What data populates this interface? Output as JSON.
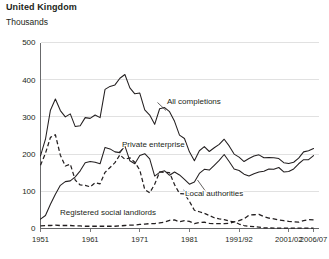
{
  "header": {
    "title": "United Kingdom",
    "unit_label": "Thousands"
  },
  "chart_data": {
    "type": "line",
    "title": "United Kingdom",
    "subtitle": "Thousands",
    "xlabel": "",
    "ylabel": "Thousands",
    "ylim": [
      0,
      500
    ],
    "xlim": [
      1951,
      2007
    ],
    "grid": true,
    "legend_position": "inline-annotations",
    "y_ticks": [
      0,
      100,
      200,
      300,
      400,
      500
    ],
    "x_ticks": [
      1951,
      1961,
      1971,
      1981,
      1991,
      2001,
      2006
    ],
    "x_tick_labels": [
      "1951",
      "1961",
      "1971",
      "1981",
      "1991/92",
      "2001/02",
      "2006/07"
    ],
    "series": [
      {
        "name": "All completions",
        "style": "solid",
        "x": [
          1951,
          1952,
          1953,
          1954,
          1955,
          1956,
          1957,
          1958,
          1959,
          1960,
          1961,
          1962,
          1963,
          1964,
          1965,
          1966,
          1967,
          1968,
          1969,
          1970,
          1971,
          1972,
          1973,
          1974,
          1975,
          1976,
          1977,
          1978,
          1979,
          1980,
          1981,
          1982,
          1983,
          1984,
          1985,
          1986,
          1987,
          1988,
          1989,
          1990,
          1991,
          1992,
          1993,
          1994,
          1995,
          1996,
          1997,
          1998,
          1999,
          2000,
          2001,
          2002,
          2003,
          2004,
          2005,
          2006
        ],
        "values": [
          195,
          240,
          318,
          348,
          317,
          300,
          308,
          274,
          276,
          298,
          296,
          305,
          298,
          374,
          382,
          386,
          404,
          414,
          378,
          362,
          364,
          319,
          305,
          280,
          322,
          325,
          314,
          288,
          251,
          242,
          206,
          182,
          209,
          220,
          207,
          217,
          226,
          240,
          222,
          200,
          192,
          180,
          188,
          195,
          198,
          190,
          191,
          190,
          188,
          177,
          175,
          178,
          189,
          206,
          209,
          215
        ],
        "annotation": "All completions"
      },
      {
        "name": "Private enterprise",
        "style": "solid",
        "x": [
          1951,
          1952,
          1953,
          1954,
          1955,
          1956,
          1957,
          1958,
          1959,
          1960,
          1961,
          1962,
          1963,
          1964,
          1965,
          1966,
          1967,
          1968,
          1969,
          1970,
          1971,
          1972,
          1973,
          1974,
          1975,
          1976,
          1977,
          1978,
          1979,
          1980,
          1981,
          1982,
          1983,
          1984,
          1985,
          1986,
          1987,
          1988,
          1989,
          1990,
          1991,
          1992,
          1993,
          1994,
          1995,
          1996,
          1997,
          1998,
          1999,
          2000,
          2001,
          2002,
          2003,
          2004,
          2005,
          2006
        ],
        "values": [
          25,
          35,
          65,
          92,
          116,
          126,
          128,
          139,
          155,
          177,
          180,
          178,
          174,
          218,
          214,
          206,
          204,
          222,
          182,
          174,
          196,
          201,
          187,
          141,
          151,
          155,
          143,
          152,
          144,
          132,
          119,
          125,
          148,
          159,
          157,
          170,
          183,
          199,
          180,
          160,
          156,
          146,
          141,
          147,
          152,
          154,
          160,
          159,
          164,
          152,
          153,
          160,
          174,
          185,
          185,
          196
        ],
        "annotation": "Private enterprise"
      },
      {
        "name": "Local authorities",
        "style": "dashed",
        "x": [
          1951,
          1952,
          1953,
          1954,
          1955,
          1956,
          1957,
          1958,
          1959,
          1960,
          1961,
          1962,
          1963,
          1964,
          1965,
          1966,
          1967,
          1968,
          1969,
          1970,
          1971,
          1972,
          1973,
          1974,
          1975,
          1976,
          1977,
          1978,
          1979,
          1980,
          1981,
          1982,
          1983,
          1984,
          1985,
          1986,
          1987,
          1988,
          1989,
          1990,
          1991,
          1992,
          1993,
          1994,
          1995,
          1996,
          1997,
          1998,
          1999,
          2000,
          2001,
          2002,
          2003,
          2004,
          2005,
          2006
        ],
        "values": [
          170,
          202,
          245,
          252,
          197,
          168,
          173,
          130,
          117,
          116,
          112,
          123,
          120,
          151,
          164,
          177,
          198,
          186,
          190,
          178,
          157,
          105,
          96,
          119,
          152,
          151,
          150,
          118,
          94,
          93,
          73,
          49,
          45,
          41,
          35,
          29,
          26,
          24,
          20,
          18,
          12,
          8,
          6,
          5,
          4,
          2,
          2,
          1,
          1,
          1,
          1,
          1,
          1,
          1,
          1,
          1
        ],
        "annotation": "Local authorities"
      },
      {
        "name": "Registered social landlords",
        "style": "dashed",
        "x": [
          1951,
          1952,
          1953,
          1954,
          1955,
          1956,
          1957,
          1958,
          1959,
          1960,
          1961,
          1962,
          1963,
          1964,
          1965,
          1966,
          1967,
          1968,
          1969,
          1970,
          1971,
          1972,
          1973,
          1974,
          1975,
          1976,
          1977,
          1978,
          1979,
          1980,
          1981,
          1982,
          1983,
          1984,
          1985,
          1986,
          1987,
          1988,
          1989,
          1990,
          1991,
          1992,
          1993,
          1994,
          1995,
          1996,
          1997,
          1998,
          1999,
          2000,
          2001,
          2002,
          2003,
          2004,
          2005,
          2006
        ],
        "values": [
          7,
          8,
          8,
          9,
          8,
          8,
          8,
          7,
          7,
          6,
          6,
          6,
          6,
          6,
          6,
          6,
          7,
          8,
          9,
          9,
          11,
          12,
          13,
          13,
          15,
          17,
          22,
          23,
          18,
          21,
          19,
          13,
          16,
          17,
          14,
          13,
          13,
          13,
          14,
          18,
          21,
          26,
          36,
          37,
          38,
          32,
          28,
          26,
          23,
          21,
          19,
          18,
          17,
          21,
          24,
          23
        ],
        "annotation": "Registered social landlords"
      }
    ],
    "annotations": [
      {
        "text": "All completions",
        "x": 1973,
        "y": 330
      },
      {
        "text": "Private enterprise",
        "x": 1964,
        "y": 205
      },
      {
        "text": "Local authorities",
        "x": 1983,
        "y": 68
      },
      {
        "text": "Registered social landlords",
        "x": 1957,
        "y": 35
      }
    ]
  }
}
